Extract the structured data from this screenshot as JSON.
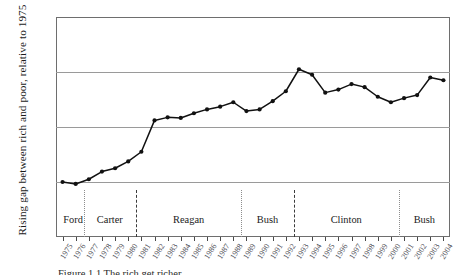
{
  "chart_data": {
    "type": "line",
    "title": "",
    "xlabel": "",
    "ylabel": "Rising gap between rich and poor, relative to 1975",
    "ylim": [
      0.8,
      1.6
    ],
    "yticks": [
      "0.8",
      "1.0",
      "1.2",
      "1.4",
      "1.6"
    ],
    "ytick_values": [
      0.8,
      1.0,
      1.2,
      1.4,
      1.6
    ],
    "grid": true,
    "legend": "none",
    "x": [
      1975,
      1976,
      1977,
      1978,
      1979,
      1980,
      1981,
      1982,
      1983,
      1984,
      1985,
      1986,
      1987,
      1988,
      1989,
      1990,
      1991,
      1992,
      1993,
      1994,
      1995,
      1996,
      1997,
      1998,
      1999,
      2000,
      2001,
      2002,
      2003,
      2004
    ],
    "xtick_labels": [
      "1975",
      "1976",
      "1977",
      "1978",
      "1979",
      "1980",
      "1981",
      "1982",
      "1983",
      "1984",
      "1985",
      "1986",
      "1987",
      "1988",
      "1989",
      "1990",
      "1991",
      "1992",
      "1993",
      "1994",
      "1995",
      "1996",
      "1997",
      "1998",
      "1999",
      "2000",
      "2001",
      "2002",
      "2003",
      "2004"
    ],
    "values": [
      1.0,
      0.993,
      1.01,
      1.038,
      1.05,
      1.075,
      1.11,
      1.224,
      1.235,
      1.233,
      1.25,
      1.264,
      1.274,
      1.29,
      1.258,
      1.264,
      1.294,
      1.33,
      1.41,
      1.39,
      1.325,
      1.336,
      1.356,
      1.345,
      1.31,
      1.29,
      1.305,
      1.316,
      1.38,
      1.37
    ],
    "series_color": "#111111",
    "gridline_color": "#9a9a9a",
    "frame_color": "#6e6e6e",
    "eras": [
      {
        "name": "Ford",
        "start": 1975,
        "end": 1976.6,
        "divider_at": 1976.6,
        "divider_style": "dotted"
      },
      {
        "name": "Carter",
        "start": 1976.6,
        "end": 1980.6,
        "divider_at": 1980.6,
        "divider_style": "dashed"
      },
      {
        "name": "Reagan",
        "start": 1980.6,
        "end": 1988.6,
        "divider_at": 1988.6,
        "divider_style": "dotted"
      },
      {
        "name": "Bush",
        "start": 1988.6,
        "end": 1992.6,
        "divider_at": 1992.6,
        "divider_style": "dashed"
      },
      {
        "name": "Clinton",
        "start": 1992.6,
        "end": 2000.6,
        "divider_at": 2000.6,
        "divider_style": "dotted"
      },
      {
        "name": "Bush",
        "start": 2000.6,
        "end": 2004.5,
        "divider_at": null,
        "divider_style": "none"
      }
    ]
  },
  "caption": {
    "text": "Figure 1.1  The rich get richer"
  }
}
